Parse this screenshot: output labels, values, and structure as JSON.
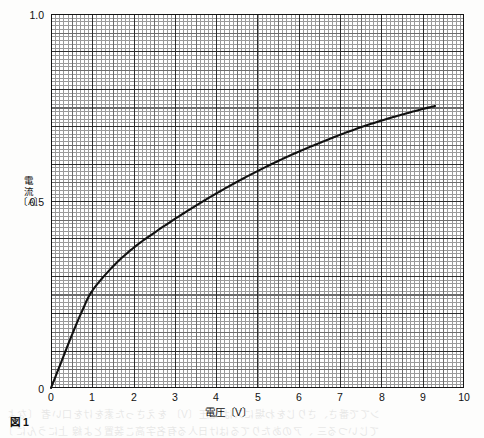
{
  "figure": {
    "caption": "図 1",
    "x_axis_title": "電圧〔V〕",
    "y_axis_title_chars": [
      "電",
      "流",
      "〔A〕"
    ]
  },
  "chart_data": {
    "type": "line",
    "title": "",
    "subtitle": "",
    "xlabel": "電圧〔V〕",
    "ylabel": "電流〔A〕",
    "xlim": [
      0,
      10
    ],
    "ylim": [
      0,
      1.0
    ],
    "grid": true,
    "grid_style": "engineering graph paper, minor 0.1 V / 0.01 A, mid 0.5 V / 0.05 A, major 1 V / 0.1 A",
    "legend": "none",
    "x_ticks": [
      "0",
      "1",
      "2",
      "3",
      "4",
      "5",
      "6",
      "7",
      "8",
      "9",
      "10"
    ],
    "x_tick_values": [
      0,
      1,
      2,
      3,
      4,
      5,
      6,
      7,
      8,
      9,
      10
    ],
    "y_ticks": [
      "0",
      "0.5",
      "1.0"
    ],
    "y_tick_values": [
      0,
      0.5,
      1.0
    ],
    "series": [
      {
        "name": "I-V characteristic",
        "color": "#111111",
        "x": [
          0,
          0.25,
          0.5,
          0.75,
          1.0,
          1.5,
          2.0,
          2.5,
          3.0,
          3.5,
          4.0,
          4.5,
          5.0,
          5.5,
          6.0,
          6.5,
          7.0,
          7.5,
          8.0,
          8.5,
          9.0,
          9.3
        ],
        "values": [
          0,
          0.07,
          0.14,
          0.205,
          0.26,
          0.325,
          0.375,
          0.415,
          0.452,
          0.487,
          0.52,
          0.551,
          0.58,
          0.607,
          0.632,
          0.655,
          0.677,
          0.697,
          0.715,
          0.731,
          0.746,
          0.754
        ]
      }
    ],
    "annotations": []
  },
  "bleed_through": {
    "note": "faint mirrored show-through text from reverse page",
    "rows": [
      "ンてで番さ、さりじをわ場にスは 電圧〔V〕 をえさった素をけを口い者 〔なよ",
      "てじいつる三 、アのあたりてるはけ日人る有名字高こ装置とよ線 上にうんに 〕"
    ]
  }
}
